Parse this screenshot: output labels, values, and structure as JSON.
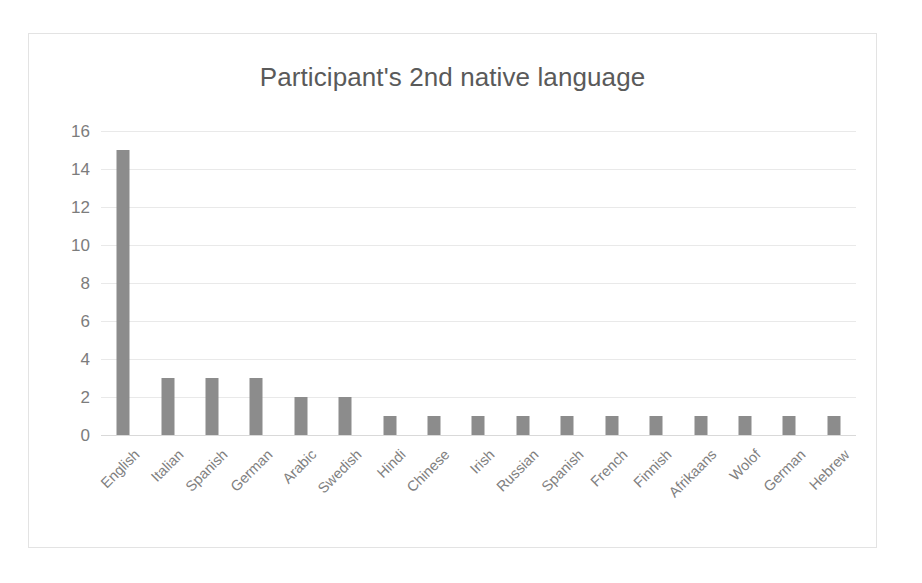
{
  "chart_data": {
    "type": "bar",
    "title": "Participant's 2nd native language",
    "xlabel": "",
    "ylabel": "",
    "categories": [
      "English",
      "Italian",
      "Spanish",
      "German",
      "Arabic",
      "Swedish",
      "Hindi",
      "Chinese",
      "Irish",
      "Russian",
      "Spanish",
      "French",
      "Finnish",
      "Afrikaans",
      "Wolof",
      "German",
      "Hebrew"
    ],
    "values": [
      15,
      3,
      3,
      3,
      2,
      2,
      1,
      1,
      1,
      1,
      1,
      1,
      1,
      1,
      1,
      1,
      1
    ],
    "ylim": [
      0,
      16
    ],
    "ytick_values": [
      0,
      2,
      4,
      6,
      8,
      10,
      12,
      14,
      16
    ],
    "ytick_labels": [
      "0",
      "2",
      "4",
      "6",
      "8",
      "10",
      "12",
      "14",
      "16"
    ],
    "grid": true,
    "legend": false,
    "legend_position": "none",
    "bar_color": "#8c8c8c",
    "gridline_color": "#e9e9e9",
    "title_color": "#5a5a5a",
    "tick_label_color": "#7f7f7f",
    "border_color": "#e3e3e3",
    "background_color": "#ffffff",
    "xtick_rotation_degrees": 45
  }
}
